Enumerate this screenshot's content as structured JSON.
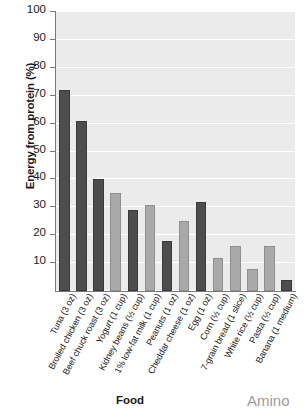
{
  "chart_data": {
    "type": "bar",
    "title": "",
    "xlabel": "Food",
    "ylabel": "Energy from protein (%)",
    "ylim": [
      0,
      100
    ],
    "ytick_step": 10,
    "yticks": [
      100,
      90,
      80,
      70,
      60,
      50,
      40,
      30,
      20,
      10
    ],
    "grid": true,
    "grid_color": "#ffffff",
    "plot_background": "#ebebeb",
    "legend": "none",
    "categories": [
      "Tuna (3 oz)",
      "Broiled chicken (3 oz)",
      "Beef chuck roast (3 oz)",
      "Yogurt (1 cup)",
      "Kidney beans (½ cup)",
      "1% low-fat milk (1 cup)",
      "Peanuts (1 oz)",
      "Cheddar cheese (1 oz)",
      "Egg (1 oz)",
      "Corn (½ cup)",
      "7-grain bread (1 slice)",
      "White rice (½ cup)",
      "Pasta (½ cup)",
      "Banana (1 medium)"
    ],
    "values": [
      72,
      61,
      40,
      35,
      29,
      31,
      18,
      25,
      32,
      12,
      16,
      8,
      16,
      4
    ],
    "bar_colors": [
      "#4d4d4d",
      "#4d4d4d",
      "#4d4d4d",
      "#a9a9a9",
      "#4d4d4d",
      "#a9a9a9",
      "#4d4d4d",
      "#a9a9a9",
      "#4d4d4d",
      "#a9a9a9",
      "#a9a9a9",
      "#a9a9a9",
      "#a9a9a9",
      "#4d4d4d"
    ],
    "palette": {
      "dark": "#4d4d4d",
      "light": "#a9a9a9",
      "axis": "#7a7a7a",
      "text": "#1a1a1a"
    }
  },
  "page": {
    "corner_text": "Amino"
  }
}
